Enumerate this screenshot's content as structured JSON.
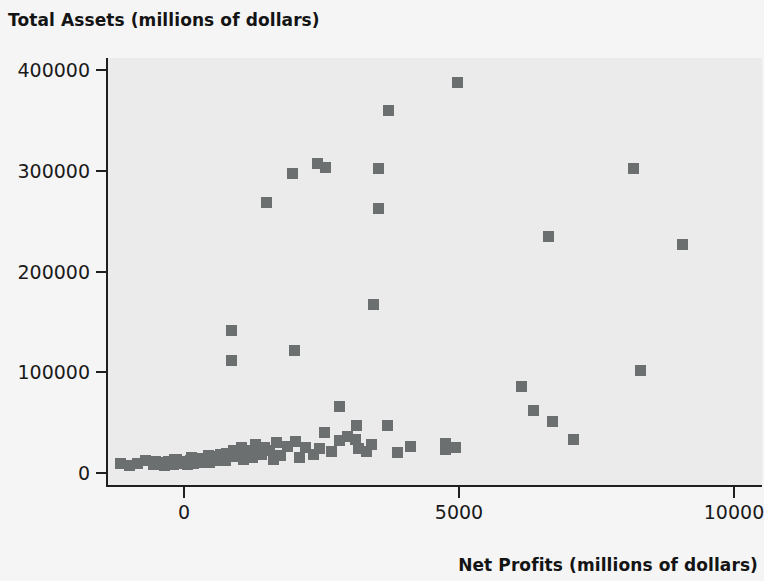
{
  "chart_data": {
    "type": "scatter",
    "title": "",
    "xlabel": "Net Profits (millions of dollars)",
    "ylabel": "Total Assets (millions of dollars)",
    "xlim": [
      -1500,
      10500
    ],
    "ylim": [
      -12000,
      412000
    ],
    "xticks": [
      0,
      5000,
      10000
    ],
    "xtick_labels": [
      "0",
      "5000",
      "10000"
    ],
    "yticks": [
      0,
      100000,
      200000,
      300000,
      400000
    ],
    "ytick_labels": [
      "0",
      "100000",
      "200000",
      "300000",
      "400000"
    ],
    "grid": false,
    "legend": null,
    "marker": "square",
    "marker_color": "#6b6f6f",
    "plot_bgcolor": "#ebebeb",
    "figure_bgcolor": "#f5f5f5",
    "points": [
      [
        4980,
        388000
      ],
      [
        3720,
        360000
      ],
      [
        2420,
        307000
      ],
      [
        2570,
        303000
      ],
      [
        3530,
        302000
      ],
      [
        8180,
        302000
      ],
      [
        1970,
        297000
      ],
      [
        3530,
        263000
      ],
      [
        1500,
        268000
      ],
      [
        6620,
        235000
      ],
      [
        9060,
        227000
      ],
      [
        3440,
        167000
      ],
      [
        870,
        141000
      ],
      [
        2000,
        122000
      ],
      [
        870,
        112000
      ],
      [
        8300,
        102000
      ],
      [
        6130,
        86000
      ],
      [
        6360,
        62000
      ],
      [
        6700,
        51000
      ],
      [
        2820,
        66000
      ],
      [
        7080,
        33000
      ],
      [
        3140,
        47000
      ],
      [
        3700,
        47000
      ],
      [
        2560,
        40000
      ],
      [
        2970,
        36000
      ],
      [
        3110,
        33000
      ],
      [
        2820,
        32000
      ],
      [
        3410,
        28000
      ],
      [
        3180,
        24000
      ],
      [
        2470,
        24000
      ],
      [
        4110,
        26000
      ],
      [
        4750,
        29000
      ],
      [
        4930,
        25000
      ],
      [
        4750,
        23000
      ],
      [
        2200,
        25000
      ],
      [
        2020,
        31000
      ],
      [
        1880,
        26000
      ],
      [
        1690,
        30000
      ],
      [
        1560,
        22000
      ],
      [
        1470,
        25000
      ],
      [
        1340,
        20000
      ],
      [
        1300,
        28000
      ],
      [
        1210,
        22000
      ],
      [
        1120,
        18000
      ],
      [
        1050,
        25000
      ],
      [
        980,
        20000
      ],
      [
        900,
        22000
      ],
      [
        840,
        16000
      ],
      [
        780,
        19000
      ],
      [
        720,
        14000
      ],
      [
        670,
        18000
      ],
      [
        610,
        12000
      ],
      [
        560,
        16000
      ],
      [
        500,
        13000
      ],
      [
        440,
        17000
      ],
      [
        390,
        11000
      ],
      [
        330,
        14000
      ],
      [
        280,
        10000
      ],
      [
        220,
        13000
      ],
      [
        170,
        9000
      ],
      [
        110,
        12000
      ],
      [
        60,
        8000
      ],
      [
        10,
        11000
      ],
      [
        -60,
        9000
      ],
      [
        -130,
        13000
      ],
      [
        -200,
        8000
      ],
      [
        -280,
        11000
      ],
      [
        -360,
        7000
      ],
      [
        -450,
        10000
      ],
      [
        -560,
        8000
      ],
      [
        -700,
        12000
      ],
      [
        -850,
        9000
      ],
      [
        -1000,
        7000
      ],
      [
        -1150,
        9000
      ],
      [
        1750,
        17000
      ],
      [
        1620,
        13000
      ],
      [
        1400,
        18000
      ],
      [
        1240,
        15000
      ],
      [
        1080,
        13000
      ],
      [
        920,
        16000
      ],
      [
        760,
        12000
      ],
      [
        600,
        15000
      ],
      [
        460,
        10000
      ],
      [
        300,
        12000
      ],
      [
        140,
        15000
      ],
      [
        -20,
        10000
      ],
      [
        -180,
        13000
      ],
      [
        -340,
        9000
      ],
      [
        -520,
        11000
      ],
      [
        2350,
        18000
      ],
      [
        2680,
        21000
      ],
      [
        3310,
        21000
      ],
      [
        3880,
        20000
      ],
      [
        2100,
        15000
      ]
    ]
  },
  "axis": {
    "x_title": "Net Profits (millions of dollars)",
    "y_title": "Total Assets (millions of dollars)"
  }
}
